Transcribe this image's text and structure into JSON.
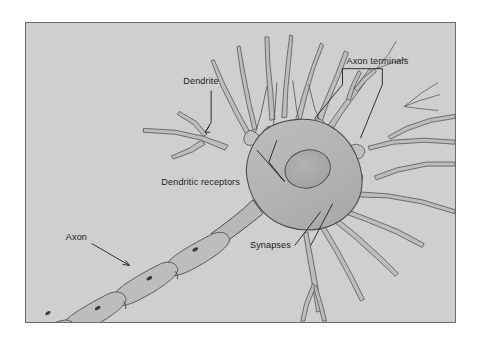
{
  "figure": {
    "kind": "neuron-anatomy-diagram",
    "frame": {
      "border_color": "#6a6a6a",
      "background_color": "#cfcfcf",
      "page_background_color": "#ffffff"
    },
    "palette": {
      "background": "#cfcfcf",
      "cell_body_fill": "#b6b6b6",
      "nucleus_fill": "#a9a9a9",
      "process_fill": "#bdbdbd",
      "outline": "#555555",
      "label_text": "#1d1d1d",
      "leader_line": "#1d1d1d"
    },
    "labels": [
      {
        "id": "dendrite",
        "text": "Dendrite",
        "x": 183,
        "y": 86,
        "anchor": "start",
        "points_to": "upper-left dendrite branch"
      },
      {
        "id": "axon-terminals",
        "text": "Axon terminals",
        "x": 347,
        "y": 78,
        "anchor": "start",
        "points_to": "two terminal boutons, bracketed leader"
      },
      {
        "id": "dendritic-receptors",
        "text": "Dendritic receptors",
        "x": 161,
        "y": 162,
        "anchor": "start",
        "points_to": "receptor bulbs on soma, bracketed leader"
      },
      {
        "id": "synapses",
        "text": "Synapses",
        "x": 250,
        "y": 236,
        "anchor": "start",
        "points_to": "synaptic contacts below soma, bracketed leader"
      },
      {
        "id": "axon",
        "text": "Axon",
        "x": 77,
        "y": 235,
        "anchor": "start",
        "points_to": "myelinated axon segment"
      }
    ],
    "parts": [
      {
        "id": "cell-body",
        "name": "cell body (soma)"
      },
      {
        "id": "nucleus",
        "name": "nucleus"
      },
      {
        "id": "dendrite-tree",
        "name": "dendrites"
      },
      {
        "id": "axon-hillock",
        "name": "axon hillock"
      },
      {
        "id": "myelinated-axon",
        "name": "myelinated axon"
      },
      {
        "id": "myelin-segments",
        "name": "myelin sheath segments",
        "count": 5
      },
      {
        "id": "nodes-of-ranvier",
        "name": "nodes of Ranvier",
        "count": 4
      },
      {
        "id": "schwann-nuclei",
        "name": "Schwann cell nuclei",
        "count": 4
      },
      {
        "id": "terminal-boutons",
        "name": "axon terminal boutons",
        "count": 8
      }
    ]
  }
}
